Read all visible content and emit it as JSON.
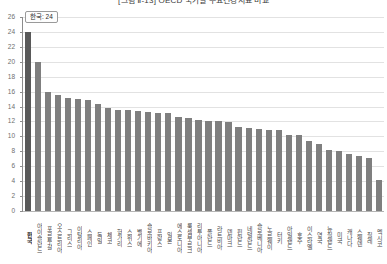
{
  "chart_data": {
    "type": "bar",
    "title": "[그림 Ⅱ-13] OECD 국가별 주요건강지표 비교",
    "xlabel": "",
    "ylabel": "",
    "ylim": [
      0,
      26
    ],
    "ytick_step": 2,
    "yticks": [
      0,
      2,
      4,
      6,
      8,
      10,
      12,
      14,
      16,
      18,
      20,
      22,
      24,
      26
    ],
    "grid": true,
    "legend": false,
    "highlight_label": "한국: 24",
    "highlight_index": 0,
    "bar_color": "#7f7f7f",
    "highlight_color": "#595959",
    "categories": [
      "한국",
      "아이슬란드",
      "포르투갈",
      "오스트리아",
      "그리스",
      "이탈리아",
      "스페인",
      "독일",
      "체코",
      "헝가리",
      "스위스",
      "벨기에",
      "슬로바키아",
      "프랑스",
      "일본",
      "에스토니아",
      "룩셈부르크",
      "리투아니아",
      "폴란드",
      "라트비아",
      "덴마크",
      "핀란드",
      "네덜란드",
      "슬로베니아",
      "노르웨이",
      "터키",
      "아일랜드",
      "호주",
      "이스라엘",
      "영국",
      "뉴질랜드",
      "미국",
      "캐나다",
      "스웨덴",
      "칠레",
      "멕시코"
    ],
    "values": [
      24.0,
      20.0,
      16.0,
      15.6,
      15.2,
      15.0,
      14.9,
      14.4,
      13.8,
      13.6,
      13.5,
      13.4,
      13.3,
      13.2,
      13.1,
      12.6,
      12.4,
      12.2,
      12.1,
      12.0,
      11.9,
      11.2,
      11.1,
      11.0,
      10.9,
      10.8,
      10.2,
      10.2,
      9.4,
      9.0,
      8.2,
      8.1,
      7.6,
      7.4,
      7.1,
      4.2
    ]
  }
}
